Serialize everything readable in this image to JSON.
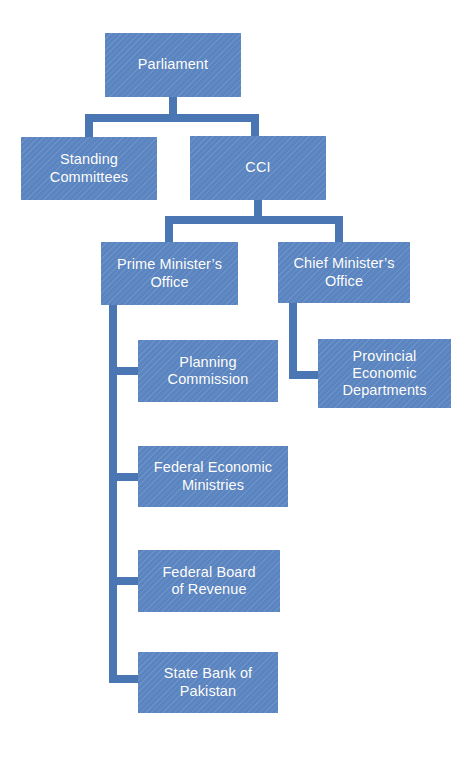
{
  "diagram": {
    "type": "organizational-chart",
    "title": "",
    "palette": {
      "node_fill": "#5b85c1",
      "node_text": "#ffffff",
      "connector": "#4a76b3",
      "background": "#ffffff"
    },
    "nodes": [
      {
        "id": "parliament",
        "label": "Parliament",
        "level": 0,
        "x": 105,
        "y": 33,
        "w": 136,
        "h": 64
      },
      {
        "id": "standing-committees",
        "label": "Standing\nCommittees",
        "level": 1,
        "x": 21,
        "y": 137,
        "w": 136,
        "h": 63
      },
      {
        "id": "cci",
        "label": "CCI",
        "level": 1,
        "x": 190,
        "y": 136,
        "w": 136,
        "h": 64
      },
      {
        "id": "prime-ministers-office",
        "label": "Prime Minister’s\nOffice",
        "level": 2,
        "x": 101,
        "y": 242,
        "w": 137,
        "h": 63
      },
      {
        "id": "chief-ministers-office",
        "label": "Chief Minister’s\nOffice",
        "level": 2,
        "x": 278,
        "y": 242,
        "w": 132,
        "h": 61
      },
      {
        "id": "planning-commission",
        "label": "Planning\nCommission",
        "level": 3,
        "x": 138,
        "y": 340,
        "w": 140,
        "h": 62
      },
      {
        "id": "provincial-economic-departments",
        "label": "Provincial\nEconomic\nDepartments",
        "level": 3,
        "x": 318,
        "y": 339,
        "w": 133,
        "h": 69
      },
      {
        "id": "federal-economic-ministries",
        "label": "Federal Economic\nMinistries",
        "level": 3,
        "x": 138,
        "y": 446,
        "w": 150,
        "h": 61
      },
      {
        "id": "federal-board-of-revenue",
        "label": "Federal Board\nof Revenue",
        "level": 3,
        "x": 138,
        "y": 550,
        "w": 142,
        "h": 62
      },
      {
        "id": "state-bank-of-pakistan",
        "label": "State Bank of\nPakistan",
        "level": 3,
        "x": 138,
        "y": 652,
        "w": 140,
        "h": 61
      }
    ],
    "edges": [
      {
        "from": "parliament",
        "to": "standing-committees"
      },
      {
        "from": "parliament",
        "to": "cci"
      },
      {
        "from": "cci",
        "to": "prime-ministers-office"
      },
      {
        "from": "cci",
        "to": "chief-ministers-office"
      },
      {
        "from": "prime-ministers-office",
        "to": "planning-commission"
      },
      {
        "from": "prime-ministers-office",
        "to": "federal-economic-ministries"
      },
      {
        "from": "prime-ministers-office",
        "to": "federal-board-of-revenue"
      },
      {
        "from": "prime-ministers-office",
        "to": "state-bank-of-pakistan"
      },
      {
        "from": "chief-ministers-office",
        "to": "provincial-economic-departments"
      }
    ]
  }
}
